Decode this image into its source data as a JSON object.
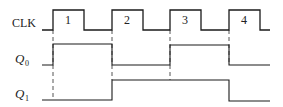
{
  "diagram": {
    "type": "timing-diagram",
    "signals": [
      {
        "name": "CLK",
        "label": "CLK",
        "subscript": "",
        "transitions_x": [
          42,
          53,
          84,
          112,
          143,
          170,
          201,
          229,
          260,
          270
        ],
        "levels": [
          "low",
          "high",
          "low",
          "high",
          "low",
          "high",
          "low",
          "high",
          "low"
        ]
      },
      {
        "name": "Q0",
        "label": "Q",
        "subscript": "0",
        "transitions_x": [
          42,
          53,
          112,
          170,
          229,
          270
        ],
        "levels": [
          "low",
          "high",
          "low",
          "high",
          "low"
        ]
      },
      {
        "name": "Q1",
        "label": "Q",
        "subscript": "1",
        "transitions_x": [
          42,
          112,
          229,
          270
        ],
        "levels": [
          "low",
          "high",
          "low"
        ]
      }
    ],
    "clock_pulse_labels": [
      "1",
      "2",
      "3",
      "4"
    ],
    "dashed_marker_x": [
      53,
      112,
      170,
      229
    ]
  },
  "colors": {
    "line": "#1a1a1a",
    "dashed": "#555555"
  }
}
